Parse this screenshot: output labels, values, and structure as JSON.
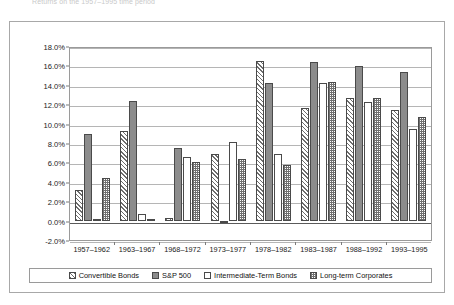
{
  "top_caption": "Returns on the 1957–1995 time period",
  "chart_data": {
    "type": "bar",
    "title": "",
    "subtitle": "",
    "xlabel": "",
    "ylabel": "",
    "ylim": [
      -2.0,
      18.0
    ],
    "ytick_step": 2.0,
    "grid": true,
    "legend_position": "bottom",
    "value_suffix": "%",
    "categories": [
      "1957–1962",
      "1963–1967",
      "1968–1972",
      "1973–1977",
      "1978–1982",
      "1983–1987",
      "1988–1992",
      "1993–1995"
    ],
    "yticks": [
      "18.0%",
      "16.0%",
      "14.0%",
      "12.0%",
      "10.0%",
      "8.0%",
      "6.0%",
      "4.0%",
      "2.0%",
      "0.0%",
      "-2.0%"
    ],
    "series": [
      {
        "name": "Convertible Bonds",
        "pattern": "diagonal-hatch",
        "values": [
          3.2,
          9.2,
          0.3,
          6.9,
          16.5,
          11.6,
          12.6,
          11.4
        ]
      },
      {
        "name": "S&P 500",
        "pattern": "solid-gray",
        "values": [
          8.9,
          12.3,
          7.5,
          -0.2,
          14.2,
          16.4,
          15.9,
          15.3
        ]
      },
      {
        "name": "Intermediate-Term Bonds",
        "pattern": "blank-white",
        "values": [
          0.0,
          0.7,
          6.6,
          8.1,
          6.9,
          14.2,
          12.2,
          9.4
        ]
      },
      {
        "name": "Long-term Corporates",
        "pattern": "checkered",
        "values": [
          4.4,
          0.2,
          6.0,
          6.4,
          5.7,
          14.3,
          12.6,
          10.7
        ]
      }
    ]
  }
}
